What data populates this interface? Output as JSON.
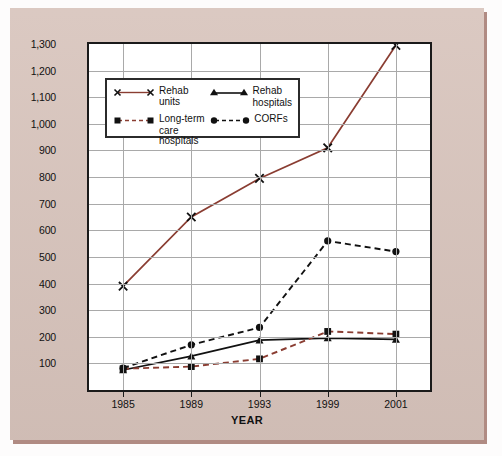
{
  "chart_data": {
    "type": "line",
    "title": "",
    "xlabel": "YEAR",
    "ylabel": "Number of rehab providers",
    "categories": [
      "1985",
      "1989",
      "1993",
      "1999",
      "2001"
    ],
    "ylim": [
      0,
      1300
    ],
    "yticks": [
      "100",
      "200",
      "300",
      "400",
      "500",
      "600",
      "700",
      "800",
      "900",
      "1,000",
      "1,100",
      "1,200",
      "1,300"
    ],
    "ytick_values": [
      100,
      200,
      300,
      400,
      500,
      600,
      700,
      800,
      900,
      1000,
      1100,
      1200,
      1300
    ],
    "grid": true,
    "legend_position": "upper-left-inside",
    "series": [
      {
        "name": "Rehab units",
        "values": [
          390,
          650,
          795,
          910,
          1295
        ],
        "color": "#8a3d32",
        "marker": "x",
        "dash": "solid"
      },
      {
        "name": "Rehab hospitals",
        "values": [
          75,
          127,
          187,
          195,
          190
        ],
        "color": "#111111",
        "marker": "triangle",
        "dash": "solid"
      },
      {
        "name": "Long-term care hospitals",
        "values": [
          80,
          88,
          117,
          220,
          210
        ],
        "color": "#8a3d32",
        "marker": "square",
        "dash": "dashed"
      },
      {
        "name": "CORFs",
        "values": [
          82,
          170,
          235,
          560,
          520
        ],
        "color": "#111111",
        "marker": "circle",
        "dash": "dashed"
      }
    ]
  },
  "legend": {
    "entries": [
      {
        "label_line1": "Rehab units",
        "label_line2": ""
      },
      {
        "label_line1": "Rehab",
        "label_line2": "hospitals"
      },
      {
        "label_line1": "Long-term",
        "label_line2": "care hospitals"
      },
      {
        "label_line1": "CORFs",
        "label_line2": ""
      }
    ]
  },
  "colors": {
    "paper": "#d7c3bb",
    "paper_shadow": "#b08b83",
    "plot_background": "#ffffff",
    "axis": "#1a1a1a",
    "grid": "#a9a9a9",
    "series_brown": "#8a3d32",
    "series_black": "#111111"
  }
}
